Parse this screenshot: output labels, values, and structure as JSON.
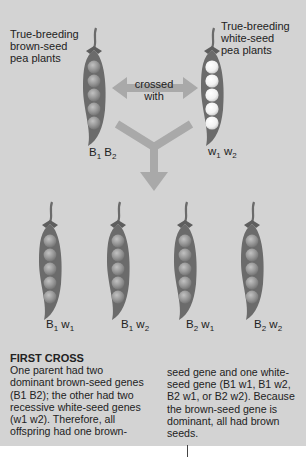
{
  "parents": {
    "brown": {
      "caption_lines": [
        "True-breeding",
        "brown-seed",
        "pea plants"
      ],
      "genotype": {
        "a": "B",
        "a_sub": "1",
        "b": "B",
        "b_sub": "2"
      },
      "seed_color": "#9a9a9a"
    },
    "white": {
      "caption_lines": [
        "True-breeding",
        "white-seed",
        "pea plants"
      ],
      "genotype": {
        "a": "w",
        "a_sub": "1",
        "b": "w",
        "b_sub": "2"
      },
      "seed_color": "#f4f4f4"
    },
    "cross_label_lines": [
      "crossed",
      "with"
    ]
  },
  "offspring": [
    {
      "a": "B",
      "a_sub": "1",
      "b": "w",
      "b_sub": "1"
    },
    {
      "a": "B",
      "a_sub": "1",
      "b": "w",
      "b_sub": "2"
    },
    {
      "a": "B",
      "a_sub": "2",
      "b": "w",
      "b_sub": "1"
    },
    {
      "a": "B",
      "a_sub": "2",
      "b": "w",
      "b_sub": "2"
    }
  ],
  "description": {
    "heading": "FIRST CROSS",
    "left_lines": [
      "One parent had two",
      "dominant brown-seed genes",
      "(B1 B2); the other had two",
      "recessive white-seed genes",
      "(w1 w2). Therefore, all",
      "offspring had one brown-"
    ],
    "right_lines": [
      "seed gene and one white-",
      "seed gene (B1 w1, B1 w2,",
      "B2 w1, or B2 w2). Because",
      "the brown-seed gene is",
      "dominant, all had brown",
      "seeds."
    ]
  },
  "colors": {
    "background": "#d3d3d3",
    "pod": "#6b6b6b",
    "arrow": "#a9a9a9",
    "text": "#222222"
  }
}
